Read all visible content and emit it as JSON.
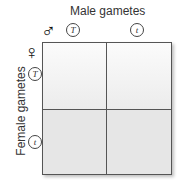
{
  "title": "Male gametes",
  "ylabel": "Female gametes",
  "male_symbol": "♂",
  "female_symbol": "♀",
  "male_alleles": [
    "T",
    "t"
  ],
  "female_alleles": [
    "T",
    "t"
  ],
  "cells": [
    [
      "",
      ""
    ],
    [
      "",
      ""
    ]
  ],
  "colors": {
    "grid_line": "#555555",
    "top_fill": "#f4f4f4",
    "bottom_fill": "#e6e6e6"
  }
}
